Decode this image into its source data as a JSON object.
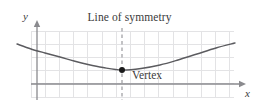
{
  "figure": {
    "width": 259,
    "height": 106,
    "background": "#ffffff",
    "title": "Line of symmetry",
    "vertex_label": "Vertex",
    "colors": {
      "grid": "#e3e3e5",
      "axis": "#8a8a8e",
      "curve": "#5b5b5f",
      "symmetry_line": "#9a9a9e",
      "vertex_point": "#1a1a1a",
      "text": "#3b3b3b"
    }
  },
  "axes": {
    "x": {
      "label": "x",
      "line": {
        "x1": 31,
        "y1": 84,
        "x2": 240,
        "y2": 84
      },
      "arrow": {
        "x": 246,
        "y": 84
      },
      "label_pos": {
        "x": 245,
        "y": 88
      }
    },
    "y": {
      "label": "y",
      "line": {
        "x1": 37,
        "y1": 100,
        "x2": 37,
        "y2": 25
      },
      "arrow": {
        "x": 37,
        "y": 20
      },
      "label_pos": {
        "x": 23,
        "y": 11
      }
    }
  },
  "grid": {
    "visible": true,
    "left": 31,
    "top": 31,
    "right": 234,
    "bottom": 97,
    "spacing": 14.2,
    "columns": 15,
    "rows": 5
  },
  "chart_data": {
    "type": "line",
    "title": "Line of symmetry",
    "xlabel": "x",
    "ylabel": "y",
    "grid": true,
    "legend": "none",
    "annotations": [
      {
        "text": "Line of symmetry",
        "x": 122,
        "y": 19,
        "kind": "title"
      },
      {
        "text": "Vertex",
        "x": 132,
        "y": 74,
        "kind": "point-label"
      }
    ],
    "series": [
      {
        "name": "parabola",
        "kind": "curve",
        "points": [
          {
            "x": 17,
            "y": 44
          },
          {
            "x": 31,
            "y": 49
          },
          {
            "x": 45,
            "y": 53
          },
          {
            "x": 60,
            "y": 57
          },
          {
            "x": 74,
            "y": 61
          },
          {
            "x": 88,
            "y": 64.5
          },
          {
            "x": 103,
            "y": 67.5
          },
          {
            "x": 122,
            "y": 70
          },
          {
            "x": 141,
            "y": 68.5
          },
          {
            "x": 160,
            "y": 65
          },
          {
            "x": 178,
            "y": 60
          },
          {
            "x": 197,
            "y": 54
          },
          {
            "x": 216,
            "y": 48
          },
          {
            "x": 235,
            "y": 43
          }
        ]
      }
    ],
    "symmetry_line": {
      "name": "Line of symmetry",
      "style": "dashed",
      "x": 122,
      "y_top": 28,
      "y_bottom": 100
    },
    "vertex": {
      "name": "Vertex",
      "x": 122,
      "y": 70,
      "radius": 3
    }
  }
}
